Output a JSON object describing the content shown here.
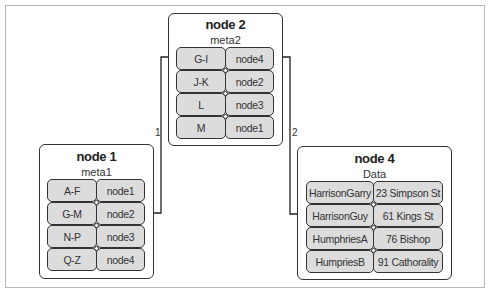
{
  "nodes": {
    "node1": {
      "title": "node 1",
      "subtitle": "meta1",
      "rows": [
        {
          "key": "A-F",
          "value": "node1"
        },
        {
          "key": "G-M",
          "value": "node2"
        },
        {
          "key": "N-P",
          "value": "node3"
        },
        {
          "key": "Q-Z",
          "value": "node4"
        }
      ]
    },
    "node2": {
      "title": "node 2",
      "subtitle": "meta2",
      "rows": [
        {
          "key": "G-I",
          "value": "node4"
        },
        {
          "key": "J-K",
          "value": "node2"
        },
        {
          "key": "L",
          "value": "node3"
        },
        {
          "key": "M",
          "value": "node1"
        }
      ]
    },
    "node4": {
      "title": "node 4",
      "subtitle": "Data",
      "rows": [
        {
          "key": "HarrisonGarry",
          "value": "23 Simpson St"
        },
        {
          "key": "HarrisonGuy",
          "value": "61 Kings St"
        },
        {
          "key": "HumphriesA",
          "value": "76 Bishop"
        },
        {
          "key": "HumpriesB",
          "value": "91 Cathorality"
        }
      ]
    }
  },
  "edges": [
    {
      "label": "1",
      "from": "node1.G-M",
      "to": "node2.G-I"
    },
    {
      "label": "2",
      "from": "node2.G-I",
      "to": "node4.HarrisonGuy"
    }
  ],
  "colors": {
    "cell_fill": "#dcdcdc",
    "stroke": "#333333",
    "frame": "#b8b8b8"
  }
}
